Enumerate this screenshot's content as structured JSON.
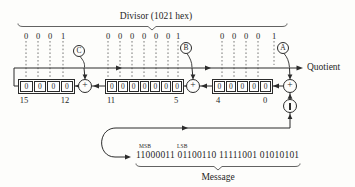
{
  "colors": {
    "line": "#2b2b2b",
    "background": "#fdfdfb"
  },
  "divisor": {
    "title": "Divisor (1021 hex)",
    "bits": {
      "group1": [
        "0",
        "0",
        "0",
        "1"
      ],
      "group2": [
        "0",
        "0",
        "0",
        "0",
        "0",
        "0",
        "1"
      ],
      "group3": [
        "0",
        "0",
        "0",
        "0",
        "1"
      ]
    }
  },
  "taps": {
    "c": "C",
    "b": "B",
    "a": "A"
  },
  "gates": {
    "xor_symbol": "+"
  },
  "quotient": {
    "label": "Quotient"
  },
  "registers": {
    "group1": [
      "0",
      "0",
      "0",
      "0"
    ],
    "group2": [
      "0",
      "0",
      "0",
      "0",
      "0",
      "0",
      "0"
    ],
    "group3": [
      "0",
      "0",
      "0",
      "0",
      "0"
    ],
    "index_labels": {
      "left_high": "15",
      "left_low": "12",
      "mid_high": "11",
      "mid_low": "5",
      "right_high": "4",
      "right_low": "0"
    }
  },
  "message": {
    "msb_label": "MSB",
    "lsb_label": "LSB",
    "bits": "11000011 01100110 11111001 01010101",
    "label": "Message"
  }
}
